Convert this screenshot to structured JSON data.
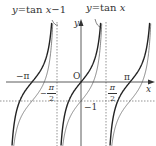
{
  "diagram": {
    "labels": {
      "curve_shifted": "y=tan x−1",
      "curve_shifted_parts": {
        "y": "y",
        "eq": "=tan ",
        "x": "x",
        "rest": "−1"
      },
      "curve_tan": "y=tan x",
      "curve_tan_parts": {
        "y": "y",
        "eq": "=tan ",
        "x": "x"
      },
      "y_axis": "y",
      "x_axis": "x",
      "origin": "O",
      "neg_pi": "−π",
      "pi": "π",
      "neg_half_pi_num": "π",
      "neg_half_pi_den": "2",
      "neg_half_pi_sign": "−",
      "half_pi_num": "π",
      "half_pi_den": "2",
      "minus_one": "−1"
    },
    "colors": {
      "tan_curve": "#222222",
      "shifted_curve": "#555555",
      "axis": "#333333",
      "dashed": "#666666"
    },
    "series": [
      {
        "name": "y=tan x",
        "style": "bold"
      },
      {
        "name": "y=tan x−1",
        "style": "thin"
      }
    ],
    "asymptotes": [
      "-π/2",
      "π/2"
    ],
    "guide_line": "y=-1",
    "x_range": [
      "-3π/2",
      "3π/2"
    ]
  }
}
